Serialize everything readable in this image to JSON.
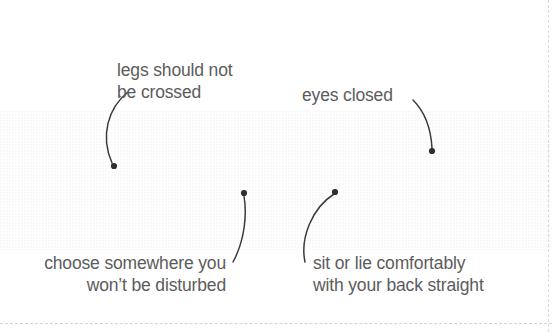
{
  "illustration": {
    "title": "relaxation-posture-diagram",
    "subject": "person lying on side with head on pillow",
    "colors": {
      "body_light": "#dedede",
      "body_mid": "#c9c9c9",
      "body_dark": "#b8b8b8",
      "skin_light": "#e6e6e6",
      "leader_line": "#3b3b3b",
      "text": "#5c5c5c",
      "background": "#ffffff",
      "guide_dash": "#d9d9d9"
    }
  },
  "callouts": [
    {
      "id": "legs",
      "text": "legs should not\nbe crossed",
      "anchor_x": 114,
      "anchor_y": 166
    },
    {
      "id": "eyes",
      "text": "eyes closed",
      "anchor_x": 432,
      "anchor_y": 151
    },
    {
      "id": "choose",
      "text": "choose somewhere you\nwon’t be disturbed",
      "anchor_x": 244,
      "anchor_y": 193
    },
    {
      "id": "sit",
      "text": "sit or lie comfortably\nwith your back straight",
      "anchor_x": 335,
      "anchor_y": 192
    }
  ]
}
